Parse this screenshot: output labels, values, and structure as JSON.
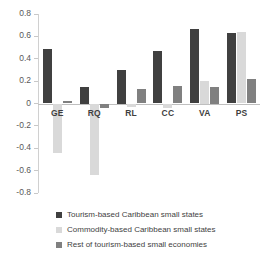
{
  "chart_data": {
    "type": "bar",
    "title": "",
    "subtitle": "",
    "xlabel": "",
    "ylabel": "",
    "ylim": [
      -0.8,
      0.8
    ],
    "grid": false,
    "legend_position": "bottom-left",
    "categories": [
      "GE",
      "RQ",
      "RL",
      "CC",
      "VA",
      "PS"
    ],
    "y_ticks": [
      "0.8",
      "0.6",
      "0.4",
      "0.2",
      "0",
      "-0.2",
      "-0.4",
      "-0.6",
      "-0.8"
    ],
    "y_tick_values": [
      0.8,
      0.6,
      0.4,
      0.2,
      0,
      -0.2,
      -0.4,
      -0.6,
      -0.8
    ],
    "series": [
      {
        "name": "Tourism-based Caribbean small states",
        "color": "#404040",
        "values": [
          0.49,
          0.15,
          0.3,
          0.47,
          0.67,
          0.63
        ]
      },
      {
        "name": "Commodity-based Caribbean small states",
        "color": "#d9d9d9",
        "values": [
          -0.44,
          -0.64,
          -0.03,
          -0.04,
          0.2,
          0.64
        ]
      },
      {
        "name": "Rest of tourism-based small economies",
        "color": "#808080",
        "values": [
          0.02,
          -0.04,
          0.13,
          0.16,
          0.15,
          0.22
        ]
      }
    ]
  },
  "axis": {
    "zero_label": "0"
  },
  "legend": {
    "items": [
      {
        "label": "Tourism-based Caribbean small states",
        "color": "#404040"
      },
      {
        "label": "Commodity-based Caribbean small states",
        "color": "#d9d9d9"
      },
      {
        "label": "Rest of tourism-based small economies",
        "color": "#808080"
      }
    ]
  }
}
